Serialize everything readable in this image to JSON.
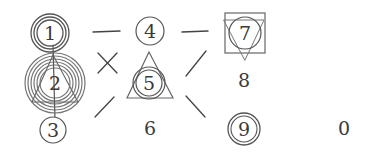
{
  "puzzle": {
    "stroke_color": "#555555",
    "ring_color": "#6a6a6a",
    "text_color": "#3a3a3a",
    "cells": [
      {
        "label": "1",
        "x": 50,
        "y": 33,
        "rings": [
          18,
          15,
          12
        ],
        "shapes": []
      },
      {
        "label": "2",
        "x": 55,
        "y": 83,
        "rings": [
          30,
          27,
          24,
          21,
          18,
          15
        ],
        "shapes": [
          "triangle"
        ]
      },
      {
        "label": "3",
        "x": 53,
        "y": 130,
        "rings": [
          13
        ],
        "shapes": []
      },
      {
        "label": "4",
        "x": 150,
        "y": 31,
        "rings": [
          14
        ],
        "shapes": []
      },
      {
        "label": "5",
        "x": 149,
        "y": 83,
        "rings": [
          15,
          12
        ],
        "shapes": [
          "triangle"
        ]
      },
      {
        "label": "6",
        "x": 150,
        "y": 128,
        "rings": [],
        "shapes": []
      },
      {
        "label": "7",
        "x": 244,
        "y": 33,
        "rings": [
          16
        ],
        "shapes": [
          "square",
          "inverted-triangle"
        ]
      },
      {
        "label": "8",
        "x": 244,
        "y": 80,
        "rings": [],
        "shapes": []
      },
      {
        "label": "9",
        "x": 244,
        "y": 129,
        "rings": [
          15,
          12
        ],
        "shapes": []
      },
      {
        "label": "0",
        "x": 344,
        "y": 128,
        "rings": [],
        "shapes": []
      }
    ],
    "connectors": [
      {
        "type": "dash",
        "between": [
          "1",
          "4"
        ]
      },
      {
        "type": "cross",
        "between": [
          "1",
          "5"
        ]
      },
      {
        "type": "slash",
        "between": [
          "2",
          "6"
        ]
      },
      {
        "type": "dash",
        "between": [
          "4",
          "7"
        ]
      },
      {
        "type": "slash",
        "between": [
          "5",
          "7"
        ]
      },
      {
        "type": "backslash",
        "between": [
          "5",
          "9"
        ]
      },
      {
        "type": "vertical",
        "between": [
          "1",
          "3"
        ]
      }
    ]
  }
}
